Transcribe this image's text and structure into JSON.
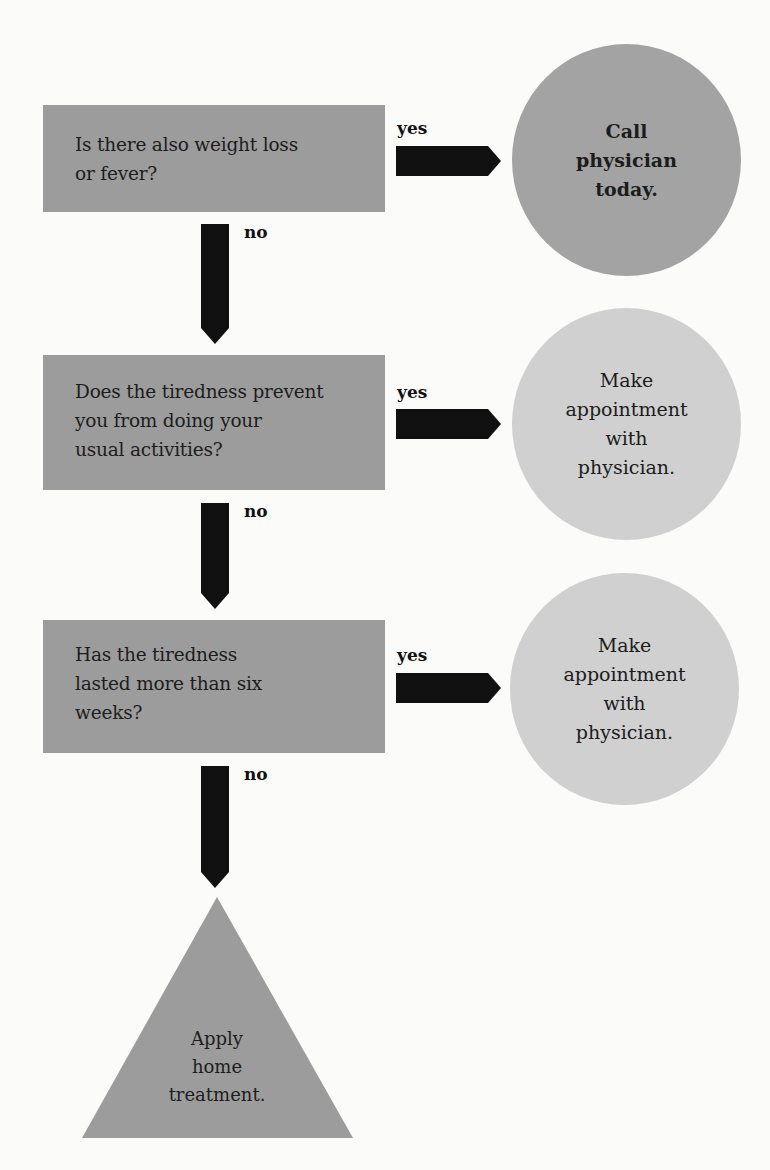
{
  "flowchart": {
    "questions": [
      {
        "text_lines": [
          "Is there also weight loss",
          "or fever?"
        ],
        "yes_label": "yes",
        "no_label": "no",
        "outcome": {
          "text": "Call\nphysician\ntoday.",
          "urgency": "urgent"
        }
      },
      {
        "text_lines": [
          "Does the tiredness prevent",
          "you from doing your",
          "usual activities?"
        ],
        "yes_label": "yes",
        "no_label": "no",
        "outcome": {
          "text": "Make\nappointment\nwith\nphysician.",
          "urgency": "routine"
        }
      },
      {
        "text_lines": [
          "Has the tiredness",
          "lasted more than six",
          "weeks?"
        ],
        "yes_label": "yes",
        "no_label": "no",
        "outcome": {
          "text": "Make\nappointment\nwith\nphysician.",
          "urgency": "routine"
        }
      }
    ],
    "final": {
      "text": "Apply\nhome\ntreatment.",
      "shape": "triangle"
    }
  },
  "colors": {
    "question_box": "#9c9c9c",
    "urgent_circle": "#a3a3a3",
    "routine_circle": "#d0d0d0",
    "triangle": "#9c9c9c",
    "arrow": "#111111",
    "background": "#fbfbfa"
  }
}
